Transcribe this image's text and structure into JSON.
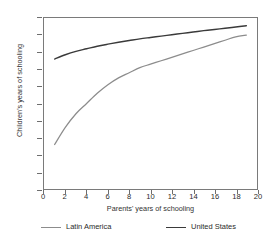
{
  "title": "and the United States",
  "axes": {
    "x_label": "Parents' years of schooling",
    "y_label": "Children's years of schooling",
    "x_ticks": [
      "0",
      "2",
      "4",
      "6",
      "8",
      "10",
      "12",
      "14",
      "16",
      "18",
      "20"
    ],
    "y_ticks": [
      "15",
      "14",
      "13",
      "12",
      "11",
      "10",
      "9",
      "8",
      "7",
      "6",
      "5"
    ]
  },
  "legend": {
    "latin_america": "Latin America",
    "united_states": "United States"
  },
  "colors": {
    "latin_america": "#8c8c8c",
    "united_states": "#3a3a3a",
    "axis": "#6e6e6e",
    "frame": "#7a7a7a",
    "text": "#2b2b2b",
    "background": "#ffffff"
  },
  "chart_data": {
    "type": "line",
    "title": "and the United States",
    "xlabel": "Parents' years of schooling",
    "ylabel": "Children's years of schooling",
    "xlim": [
      0,
      20
    ],
    "ylim": [
      5,
      15
    ],
    "xticks": [
      0,
      2,
      4,
      6,
      8,
      10,
      12,
      14,
      16,
      18,
      20
    ],
    "yticks": [
      5,
      6,
      7,
      8,
      9,
      10,
      11,
      12,
      13,
      14,
      15
    ],
    "grid": false,
    "legend_position": "bottom",
    "series": [
      {
        "name": "Latin America",
        "color": "#8c8c8c",
        "x": [
          1,
          2,
          3,
          4,
          5,
          6,
          7,
          8,
          9,
          10,
          11,
          12,
          13,
          14,
          15,
          16,
          17,
          18,
          19
        ],
        "y": [
          7.6,
          8.6,
          9.4,
          10.0,
          10.6,
          11.1,
          11.5,
          11.8,
          12.1,
          12.3,
          12.5,
          12.7,
          12.9,
          13.1,
          13.3,
          13.5,
          13.7,
          13.9,
          14.0
        ]
      },
      {
        "name": "United States",
        "color": "#3a3a3a",
        "x": [
          1,
          2,
          3,
          4,
          5,
          6,
          7,
          8,
          9,
          10,
          11,
          12,
          13,
          14,
          15,
          16,
          17,
          18,
          19
        ],
        "y": [
          12.6,
          12.85,
          13.05,
          13.2,
          13.35,
          13.47,
          13.58,
          13.68,
          13.78,
          13.86,
          13.94,
          14.02,
          14.1,
          14.18,
          14.26,
          14.33,
          14.4,
          14.47,
          14.55
        ]
      }
    ]
  }
}
